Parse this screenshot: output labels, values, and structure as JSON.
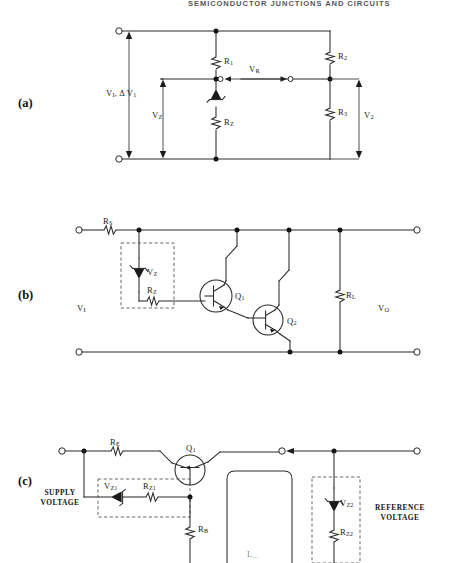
{
  "page": {
    "running_head": "SEMICONDUCTOR JUNCTIONS AND CIRCUITS",
    "background": "#ffffff",
    "ink": "#1b1b1b"
  },
  "panels": [
    {
      "id": "a",
      "letter": "(a)"
    },
    {
      "id": "b",
      "letter": "(b)"
    },
    {
      "id": "c",
      "letter": "(c)"
    }
  ],
  "figure_a": {
    "title": "Cascaded zener voltage regulator",
    "labels": {
      "vin": "V",
      "vin_sub": "I",
      "vin_delta": ", Δ V",
      "vin_delta_sub": "1",
      "vz": "V",
      "vz_sub": "Z",
      "vr": "V",
      "vr_sub": "R",
      "v2": "V",
      "v2_sub": "2",
      "r1": "R",
      "r1_sub": "1",
      "r2": "R",
      "r2_sub": "2",
      "r3": "R",
      "r3_sub": "3",
      "rz": "R",
      "rz_sub": "Z"
    }
  },
  "figure_b": {
    "title": "Darlington series regulator with zener reference",
    "labels": {
      "rs": "R",
      "rs_sub": "S",
      "vz": "V",
      "vz_sub": "Z",
      "rz": "R",
      "rz_sub": "Z",
      "vi": "V",
      "vi_sub": "I",
      "vo": "V",
      "vo_sub": "O",
      "q1": "Q",
      "q1_sub": "1",
      "q2": "Q",
      "q2_sub": "2",
      "rl": "R",
      "rl_sub": "L"
    }
  },
  "figure_c": {
    "title": "Series regulator with supply and reference zeners",
    "labels": {
      "supply_voltage": "SUPPLY\nVOLTAGE",
      "supply_voltage_l1": "SUPPLY",
      "supply_voltage_l2": "VOLTAGE",
      "reference_voltage_l1": "REFERENCE",
      "reference_voltage_l2": "VOLTAGE",
      "re": "R",
      "re_sub": "E",
      "q1": "Q",
      "q1_sub": "1",
      "vz1": "V",
      "vz1_sub": "Z1",
      "rz1": "R",
      "rz1_sub": "Z1",
      "rb": "R",
      "rb_sub": "B",
      "vz2": "V",
      "vz2_sub": "Z2",
      "rz2": "R",
      "rz2_sub": "Z2",
      "cut_label": "L",
      "cut_label_sub": "…"
    }
  }
}
